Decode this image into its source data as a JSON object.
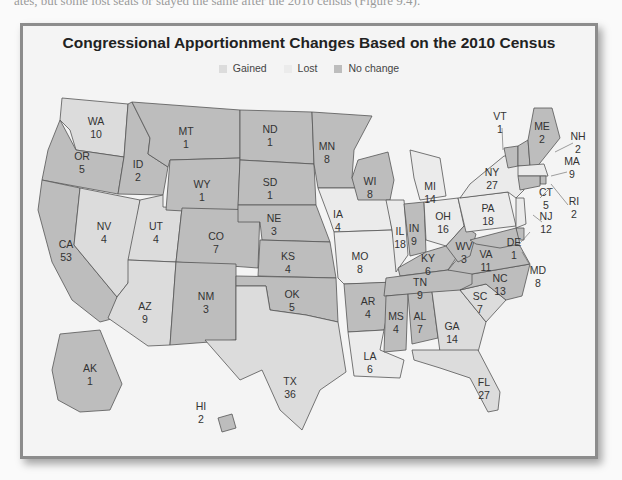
{
  "caption_fragment": "ates, but some lost seats or stayed the same after the 2010 census (Figure 9.4).",
  "chart_data": {
    "type": "choropleth-map",
    "title": "Congressional Apportionment Changes Based on the 2010 Census",
    "legend": [
      {
        "key": "gained",
        "label": "Gained",
        "color": "#dcdcdc"
      },
      {
        "key": "lost",
        "label": "Lost",
        "color": "#ebebeb"
      },
      {
        "key": "nochange",
        "label": "No change",
        "color": "#bdbdbd"
      }
    ],
    "states": [
      {
        "abbr": "WA",
        "seats": 10,
        "status": "gained"
      },
      {
        "abbr": "OR",
        "seats": 5,
        "status": "nochange"
      },
      {
        "abbr": "CA",
        "seats": 53,
        "status": "nochange"
      },
      {
        "abbr": "ID",
        "seats": 2,
        "status": "nochange"
      },
      {
        "abbr": "NV",
        "seats": 4,
        "status": "gained"
      },
      {
        "abbr": "UT",
        "seats": 4,
        "status": "gained"
      },
      {
        "abbr": "AZ",
        "seats": 9,
        "status": "gained"
      },
      {
        "abbr": "MT",
        "seats": 1,
        "status": "nochange"
      },
      {
        "abbr": "WY",
        "seats": 1,
        "status": "nochange"
      },
      {
        "abbr": "CO",
        "seats": 7,
        "status": "nochange"
      },
      {
        "abbr": "NM",
        "seats": 3,
        "status": "nochange"
      },
      {
        "abbr": "ND",
        "seats": 1,
        "status": "nochange"
      },
      {
        "abbr": "SD",
        "seats": 1,
        "status": "nochange"
      },
      {
        "abbr": "NE",
        "seats": 3,
        "status": "nochange"
      },
      {
        "abbr": "KS",
        "seats": 4,
        "status": "nochange"
      },
      {
        "abbr": "OK",
        "seats": 5,
        "status": "nochange"
      },
      {
        "abbr": "TX",
        "seats": 36,
        "status": "gained"
      },
      {
        "abbr": "MN",
        "seats": 8,
        "status": "nochange"
      },
      {
        "abbr": "IA",
        "seats": 4,
        "status": "lost"
      },
      {
        "abbr": "MO",
        "seats": 8,
        "status": "lost"
      },
      {
        "abbr": "AR",
        "seats": 4,
        "status": "nochange"
      },
      {
        "abbr": "LA",
        "seats": 6,
        "status": "lost"
      },
      {
        "abbr": "WI",
        "seats": 8,
        "status": "nochange"
      },
      {
        "abbr": "IL",
        "seats": 18,
        "status": "lost"
      },
      {
        "abbr": "MI",
        "seats": 14,
        "status": "lost"
      },
      {
        "abbr": "IN",
        "seats": 9,
        "status": "nochange"
      },
      {
        "abbr": "OH",
        "seats": 16,
        "status": "lost"
      },
      {
        "abbr": "KY",
        "seats": 6,
        "status": "nochange"
      },
      {
        "abbr": "TN",
        "seats": 9,
        "status": "nochange"
      },
      {
        "abbr": "MS",
        "seats": 4,
        "status": "nochange"
      },
      {
        "abbr": "AL",
        "seats": 7,
        "status": "nochange"
      },
      {
        "abbr": "GA",
        "seats": 14,
        "status": "gained"
      },
      {
        "abbr": "FL",
        "seats": 27,
        "status": "gained"
      },
      {
        "abbr": "SC",
        "seats": 7,
        "status": "gained"
      },
      {
        "abbr": "NC",
        "seats": 13,
        "status": "nochange"
      },
      {
        "abbr": "VA",
        "seats": 11,
        "status": "nochange"
      },
      {
        "abbr": "WV",
        "seats": 3,
        "status": "nochange"
      },
      {
        "abbr": "PA",
        "seats": 18,
        "status": "lost"
      },
      {
        "abbr": "NY",
        "seats": 27,
        "status": "lost"
      },
      {
        "abbr": "VT",
        "seats": 1,
        "status": "nochange"
      },
      {
        "abbr": "NH",
        "seats": 2,
        "status": "nochange"
      },
      {
        "abbr": "ME",
        "seats": 2,
        "status": "nochange"
      },
      {
        "abbr": "MA",
        "seats": 9,
        "status": "lost"
      },
      {
        "abbr": "RI",
        "seats": 2,
        "status": "nochange"
      },
      {
        "abbr": "CT",
        "seats": 5,
        "status": "nochange"
      },
      {
        "abbr": "NJ",
        "seats": 12,
        "status": "lost"
      },
      {
        "abbr": "DE",
        "seats": 1,
        "status": "nochange"
      },
      {
        "abbr": "MD",
        "seats": 8,
        "status": "nochange"
      },
      {
        "abbr": "AK",
        "seats": 1,
        "status": "nochange"
      },
      {
        "abbr": "HI",
        "seats": 2,
        "status": "nochange"
      }
    ]
  }
}
